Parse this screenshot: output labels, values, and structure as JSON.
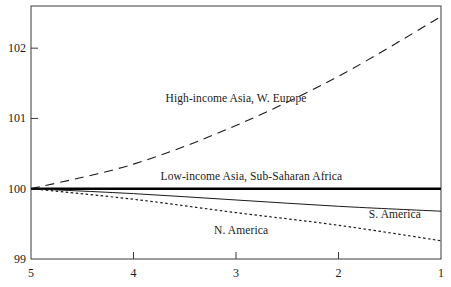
{
  "chart_data": {
    "type": "line",
    "title": "",
    "subtitle": "",
    "xlabel": "",
    "ylabel": "",
    "xlim": [
      5,
      1
    ],
    "ylim": [
      99,
      102.6
    ],
    "x_ticks": [
      "5",
      "4",
      "3",
      "2",
      "1"
    ],
    "x_tick_values": [
      5,
      4,
      3,
      2,
      1
    ],
    "y_ticks": [
      "99",
      "100",
      "101",
      "102"
    ],
    "y_tick_values": [
      99,
      100,
      101,
      102
    ],
    "x_axis_reversed": true,
    "grid": false,
    "legend_position": "inline-annotations",
    "frame": "box",
    "x": [
      5,
      4,
      3,
      2,
      1
    ],
    "series": [
      {
        "name": "High-income Asia, W. Europe",
        "style": "dashed",
        "color": "#1a1a1a",
        "width": 1.1,
        "values": [
          100.0,
          100.35,
          100.9,
          101.6,
          102.45
        ],
        "label_x": 3,
        "label_y": 101.28
      },
      {
        "name": "Low-income Asia, Sub-Saharan Africa",
        "style": "solid-thick",
        "color": "#000000",
        "width": 2.6,
        "values": [
          100.0,
          100.0,
          100.0,
          100.0,
          100.0
        ],
        "label_x": 2.85,
        "label_y": 100.17
      },
      {
        "name": "S. America",
        "style": "solid-thin",
        "color": "#1a1a1a",
        "width": 1.0,
        "values": [
          100.0,
          99.93,
          99.84,
          99.75,
          99.68
        ],
        "label_x": 1.45,
        "label_y": 99.62
      },
      {
        "name": "N. America",
        "style": "dotted",
        "color": "#1a1a1a",
        "width": 1.2,
        "values": [
          100.0,
          99.85,
          99.66,
          99.48,
          99.26
        ],
        "label_x": 2.95,
        "label_y": 99.4
      }
    ]
  },
  "axis": {
    "y_labels": [
      {
        "text": "102",
        "value": 102
      },
      {
        "text": "101",
        "value": 101
      },
      {
        "text": "100",
        "value": 100
      },
      {
        "text": "99",
        "value": 99
      }
    ],
    "x_labels": [
      {
        "text": "5",
        "value": 5
      },
      {
        "text": "4",
        "value": 4
      },
      {
        "text": "3",
        "value": 3
      },
      {
        "text": "2",
        "value": 2
      },
      {
        "text": "1",
        "value": 1
      }
    ]
  },
  "annotations": [
    {
      "text": "High-income Asia, W. Europe"
    },
    {
      "text": "Low-income Asia, Sub-Saharan Africa"
    },
    {
      "text": "S. America"
    },
    {
      "text": "N. America"
    }
  ]
}
